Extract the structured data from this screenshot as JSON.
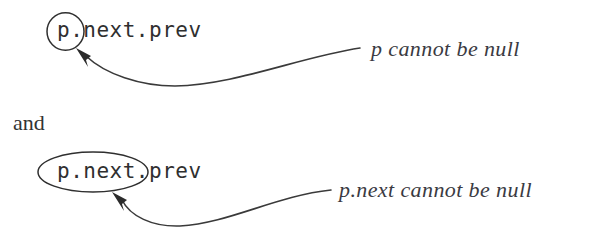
{
  "figure": {
    "background_color": "#ffffff",
    "ink_color": "#2f2f2f",
    "annotation_color": "#3a3a42"
  },
  "statements": [
    {
      "expression": "p.next.prev",
      "highlight_shape": "circle",
      "highlight_target": "p.",
      "annotation": "p cannot be null"
    },
    {
      "expression": "p.next.prev",
      "highlight_shape": "ellipse",
      "highlight_target": "p.next.",
      "annotation": "p.next cannot be null"
    }
  ],
  "conjunction": "and",
  "icons": {
    "arrow": "curved-arrow-icon",
    "circle": "circle-highlight-icon",
    "ellipse": "ellipse-highlight-icon"
  }
}
